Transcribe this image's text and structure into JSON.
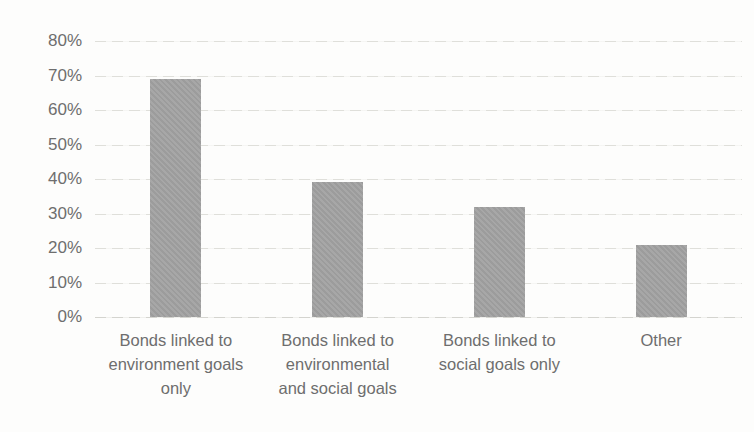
{
  "chart_data": {
    "type": "bar",
    "title": "",
    "xlabel": "",
    "ylabel": "",
    "categories": [
      "Bonds linked to environment goals only",
      "Bonds linked to environmental and social goals",
      "Bonds linked to social goals only",
      "Other"
    ],
    "category_lines": [
      [
        "Bonds linked to",
        "environment goals",
        "only"
      ],
      [
        "Bonds linked to",
        "environmental",
        "and social goals"
      ],
      [
        "Bonds linked to",
        "social goals only"
      ],
      [
        "Other"
      ]
    ],
    "values": [
      69,
      39,
      32,
      21
    ],
    "unit": "%",
    "ylim": [
      0,
      80
    ],
    "y_tick_step": 10,
    "y_tick_labels": [
      "0%",
      "10%",
      "20%",
      "30%",
      "40%",
      "50%",
      "60%",
      "70%",
      "80%"
    ],
    "grid": "horizontal-light-dashed",
    "legend": "none",
    "colors": {
      "bar": "#a2a2a2",
      "text": "#6e6e6e",
      "gridline": "#dfdfda",
      "background": "#fdfdfc"
    }
  }
}
